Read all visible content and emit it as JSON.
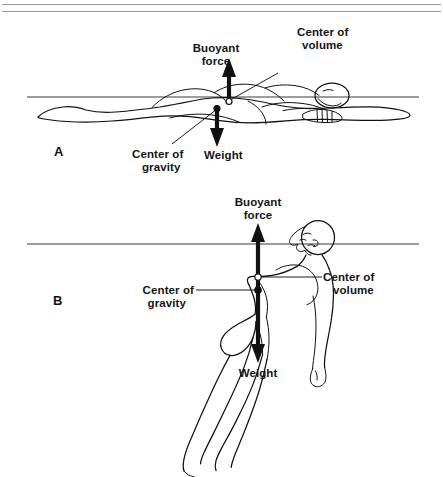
{
  "figure": {
    "colors": {
      "ink": "#111111",
      "rule": "#9a9a9a",
      "waterline": "#3b3b3b",
      "background": "#ffffff"
    }
  },
  "panels": [
    {
      "id": "A",
      "letter": "A",
      "description": "Horizontal back-float position",
      "labels": {
        "buoyant_force_line1": "Buoyant",
        "buoyant_force_line2": "force",
        "center_of_volume_line1": "Center of",
        "center_of_volume_line2": "volume",
        "center_of_gravity_line1": "Center of",
        "center_of_gravity_line2": "gravity",
        "weight": "Weight"
      }
    },
    {
      "id": "B",
      "letter": "B",
      "description": "Vertical / tilted float position with legs sinking",
      "labels": {
        "buoyant_force_line1": "Buoyant",
        "buoyant_force_line2": "force",
        "center_of_volume_line1": "Center of",
        "center_of_volume_line2": "volume",
        "center_of_gravity_line1": "Center of",
        "center_of_gravity_line2": "gravity",
        "weight": "Weight"
      }
    }
  ]
}
